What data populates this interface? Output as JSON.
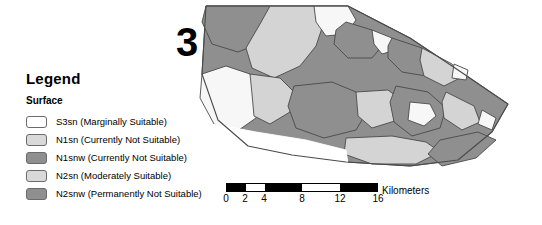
{
  "map_number": "3",
  "legend": {
    "title": "Legend",
    "subtitle": "Surface",
    "items": [
      {
        "label": "S3sn (Marginally Suitable)",
        "color": "#ffffff"
      },
      {
        "label": "N1sn (Currently Not Suitable)",
        "color": "#d9d9d9"
      },
      {
        "label": "N1snw (Currently Not Suitable)",
        "color": "#8f8f8f"
      },
      {
        "label": "N2sn (Moderately Suitable)",
        "color": "#d9d9d9"
      },
      {
        "label": "N2snw (Permanently Not Suitable)",
        "color": "#8f8f8f"
      }
    ]
  },
  "scalebar": {
    "units": "Kilometers",
    "ticks": [
      "0",
      "2",
      "4",
      "8",
      "12",
      "16"
    ],
    "tick_values": [
      0,
      2,
      4,
      8,
      12,
      16
    ],
    "max_value": 16,
    "segments": [
      {
        "from": 0,
        "to": 2,
        "fill": "black"
      },
      {
        "from": 2,
        "to": 4,
        "fill": "white"
      },
      {
        "from": 4,
        "to": 8,
        "fill": "black"
      },
      {
        "from": 8,
        "to": 12,
        "fill": "white"
      },
      {
        "from": 12,
        "to": 16,
        "fill": "black"
      }
    ]
  },
  "map": {
    "background": "#ffffff",
    "outline_color": "#4a4a4a",
    "fills": {
      "white": "#f7f7f7",
      "light": "#d4d4d4",
      "dark": "#8f8f8f"
    }
  }
}
